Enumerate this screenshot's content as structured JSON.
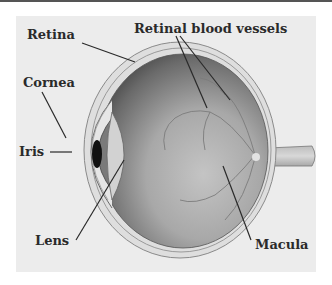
{
  "diagram": {
    "labels": {
      "retina": "Retina",
      "retinal_blood_vessels": "Retinal blood vessels",
      "cornea": "Cornea",
      "iris": "Iris",
      "lens": "Lens",
      "macula": "Macula"
    },
    "colors": {
      "panel_bg": "#ececec",
      "label_text": "#2a2a2a",
      "eyeball_dark": "#4a4a4a",
      "eyeball_light": "#b8b8b8"
    }
  }
}
